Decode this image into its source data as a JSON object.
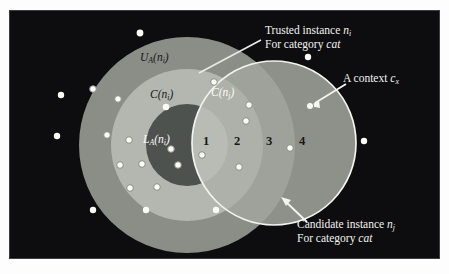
{
  "figure": {
    "type": "venn-region-diagram",
    "background_color": "#0d0d0f",
    "frame_color": "#fdfdfd"
  },
  "sets": {
    "outer_ring_label": "U",
    "outer_ring_sub": "A",
    "outer_ring_arg": "(n",
    "outer_ring_arg_sub": "i",
    "outer_ring_full": "U_A(n_i)",
    "middle_ring_full": "C(n_i)",
    "core_full": "L_A(n_i)",
    "right_circle_full": "C(n_j)"
  },
  "labels": {
    "trusted_line1": "Trusted instance n",
    "trusted_line1_sub": "i",
    "trusted_line2_pre": "For category ",
    "trusted_line2_em": "cat",
    "context_pre": "A context ",
    "context_em": "c",
    "context_sub": "x",
    "candidate_line1": "Candidate instance n",
    "candidate_line1_sub": "j",
    "candidate_line2_pre": "For category ",
    "candidate_line2_em": "cat"
  },
  "regions": [
    {
      "id": "1",
      "number": "1",
      "fill": "#b9bcb4",
      "desc": "core-of-ni intersect C(nj)"
    },
    {
      "id": "2",
      "number": "2",
      "fill": "#aeb1a9",
      "desc": "C(ni) intersect C(nj)"
    },
    {
      "id": "3",
      "number": "3",
      "fill": "#9fa29a",
      "desc": "U_A(ni) intersect C(nj)"
    },
    {
      "id": "4",
      "number": "4",
      "fill": "#8e918a",
      "desc": "C(nj) only"
    }
  ],
  "colors": {
    "outer_ring": "#8b8e87",
    "middle_ring": "#b4b7af",
    "core": "#4e524f",
    "right_circle_outline": "#f2f2ee",
    "dot_fill": "#fbfbf6",
    "dot_stroke": "#8a8d86",
    "leader_line": "#ecece8"
  },
  "geometry": {
    "left_circle_center": [
      178,
      135
    ],
    "outer_radius": 108,
    "middle_radius": 76,
    "core_radius": 41,
    "right_circle_center": [
      265,
      133
    ],
    "right_radius": 82
  },
  "dots": {
    "outside": [
      [
        131,
        23
      ],
      [
        52,
        85
      ],
      [
        48,
        126
      ],
      [
        84,
        200
      ],
      [
        137,
        200
      ],
      [
        207,
        200
      ],
      [
        355,
        131
      ],
      [
        299,
        47
      ]
    ],
    "outer_ring": [
      [
        84,
        79
      ],
      [
        98,
        125
      ],
      [
        111,
        155
      ],
      [
        121,
        178
      ],
      [
        148,
        177
      ],
      [
        169,
        155
      ]
    ],
    "middle_ring": [
      [
        109,
        89
      ],
      [
        120,
        130
      ],
      [
        133,
        154
      ]
    ],
    "core": [
      [
        157,
        97
      ]
    ],
    "region1": [
      [
        162,
        139
      ]
    ],
    "region2": [
      [
        193,
        145
      ],
      [
        205,
        72
      ]
    ],
    "region3": [
      [
        230,
        157
      ],
      [
        240,
        95
      ],
      [
        237,
        111
      ]
    ],
    "region4": [
      [
        281,
        138
      ],
      [
        301,
        96
      ]
    ],
    "context_target": [
      301,
      96
    ]
  }
}
